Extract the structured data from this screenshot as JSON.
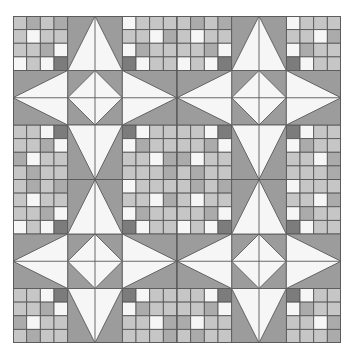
{
  "palette": {
    "background": "#ffffff",
    "field": "#9c9c9c",
    "white": "#f6f6f6",
    "light": "#c6c6c6",
    "mid": "#ababab",
    "dark": "#7c7c7c",
    "line": "#5a5a5a"
  },
  "quilt": {
    "star_blocks_grid": [
      2,
      2
    ],
    "units_per_block": [
      3,
      3
    ],
    "checker_size": 4,
    "checkers": {
      "top_left": [
        [
          "light",
          "mid",
          "light",
          "mid"
        ],
        [
          "light",
          "white",
          "light",
          "light"
        ],
        [
          "light",
          "light",
          "mid",
          "white"
        ],
        [
          "white",
          "light",
          "white",
          "dark"
        ]
      ],
      "top_right": [
        [
          "white",
          "light",
          "light",
          "light"
        ],
        [
          "light",
          "light",
          "white",
          "mid"
        ],
        [
          "white",
          "mid",
          "light",
          "light"
        ],
        [
          "dark",
          "white",
          "light",
          "light"
        ]
      ],
      "bottom_left": [
        [
          "light",
          "light",
          "white",
          "dark"
        ],
        [
          "light",
          "light",
          "mid",
          "white"
        ],
        [
          "mid",
          "white",
          "light",
          "light"
        ],
        [
          "light",
          "mid",
          "light",
          "light"
        ]
      ],
      "bottom_right": [
        [
          "dark",
          "white",
          "light",
          "light"
        ],
        [
          "white",
          "mid",
          "light",
          "light"
        ],
        [
          "light",
          "light",
          "white",
          "mid"
        ],
        [
          "light",
          "light",
          "light",
          "mid"
        ]
      ]
    },
    "points": [
      "top",
      "left",
      "right",
      "bottom"
    ],
    "center": "diamond"
  }
}
